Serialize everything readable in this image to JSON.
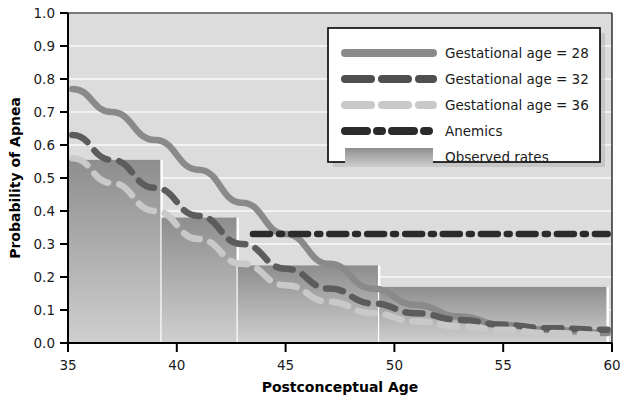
{
  "chart_data": {
    "type": "line",
    "title": "",
    "xlabel": "Postconceptual Age",
    "ylabel": "Probability of Apnea",
    "xlim": [
      35,
      60
    ],
    "ylim": [
      0.0,
      1.0
    ],
    "xticks": [
      "35",
      "40",
      "45",
      "50",
      "55",
      "60"
    ],
    "xtick_values": [
      35,
      40,
      45,
      50,
      55,
      60
    ],
    "yticks": [
      "0.0",
      "0.1",
      "0.2",
      "0.3",
      "0.4",
      "0.5",
      "0.6",
      "0.7",
      "0.8",
      "0.9",
      "1.0"
    ],
    "ytick_values": [
      0.0,
      0.1,
      0.2,
      0.3,
      0.4,
      0.5,
      0.6,
      0.7,
      0.8,
      0.9,
      1.0
    ],
    "grid": "horizontal-white-on-gray",
    "legend_position": "top-right",
    "series": [
      {
        "name": "Gestational age = 28",
        "style": "solid",
        "color": "#8a8a8a",
        "x": [
          35.2,
          37,
          39,
          41,
          43,
          45,
          47,
          49,
          51,
          53,
          55,
          57,
          59.8
        ],
        "values": [
          0.77,
          0.7,
          0.615,
          0.525,
          0.425,
          0.33,
          0.24,
          0.165,
          0.115,
          0.08,
          0.055,
          0.04,
          0.03
        ]
      },
      {
        "name": "Gestational age = 32",
        "style": "dashed",
        "color": "#5c5c5c",
        "x": [
          35.2,
          37,
          39,
          41,
          43,
          45,
          47,
          49,
          51,
          53,
          55,
          57,
          59.8
        ],
        "values": [
          0.63,
          0.555,
          0.47,
          0.385,
          0.3,
          0.225,
          0.165,
          0.12,
          0.09,
          0.07,
          0.055,
          0.045,
          0.04
        ]
      },
      {
        "name": "Gestational age = 36",
        "style": "dashed",
        "color": "#c9c9c9",
        "x": [
          35.2,
          37,
          39,
          41,
          43,
          45,
          47,
          49,
          51,
          53,
          55,
          57,
          59.8
        ],
        "values": [
          0.56,
          0.485,
          0.4,
          0.315,
          0.24,
          0.175,
          0.125,
          0.09,
          0.065,
          0.05,
          0.04,
          0.03,
          0.025
        ]
      },
      {
        "name": "Anemics",
        "style": "dash-dot",
        "color": "#2b2b2b",
        "x": [
          43.5,
          59.8
        ],
        "values": [
          0.33,
          0.33
        ]
      }
    ],
    "bars": {
      "name": "Observed rates",
      "color": "#9a9a9a",
      "fill": "vertical-gradient-gray",
      "bins": [
        {
          "x0": 35.0,
          "x1": 39.3,
          "value": 0.555
        },
        {
          "x0": 39.3,
          "x1": 42.8,
          "value": 0.38
        },
        {
          "x0": 42.8,
          "x1": 49.3,
          "value": 0.235
        },
        {
          "x0": 49.3,
          "x1": 59.8,
          "value": 0.17
        }
      ]
    },
    "legend_entries": [
      {
        "label": "Gestational age = 28",
        "swatch": "solid-line",
        "color": "#8a8a8a"
      },
      {
        "label": "Gestational age = 32",
        "swatch": "dashed-line",
        "color": "#4f4f4f"
      },
      {
        "label": "Gestational age = 36",
        "swatch": "dashed-line",
        "color": "#c9c9c9"
      },
      {
        "label": "Anemics",
        "swatch": "dash-dot-line",
        "color": "#2b2b2b"
      },
      {
        "label": "Observed rates",
        "swatch": "filled-rect",
        "color": "#9a9a9a"
      }
    ]
  },
  "axes": {
    "x_label": "Postconceptual Age",
    "y_label": "Probability of Apnea"
  },
  "colors": {
    "plot_background": "#dcdcdc",
    "grid_line": "#f2f2f2",
    "axis_line": "#000000",
    "legend_background": "#ffffff",
    "legend_border": "#000000",
    "page_background": "#ffffff"
  }
}
